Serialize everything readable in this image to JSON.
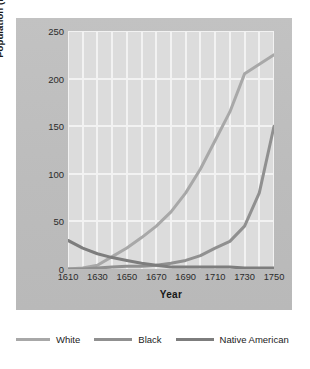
{
  "chart_data": {
    "type": "line",
    "title": "",
    "xlabel": "Year",
    "ylabel": "Population (in thousands)",
    "xlim": [
      1610,
      1750
    ],
    "ylim": [
      0,
      250
    ],
    "xticks": [
      1610,
      1630,
      1650,
      1670,
      1690,
      1710,
      1730,
      1750
    ],
    "yticks": [
      0,
      50,
      100,
      150,
      200,
      250
    ],
    "grid": true,
    "legend_position": "below",
    "x": [
      1610,
      1620,
      1630,
      1640,
      1650,
      1660,
      1670,
      1680,
      1690,
      1700,
      1710,
      1720,
      1730,
      1740,
      1750
    ],
    "series": [
      {
        "name": "White",
        "color": "#a8a8a8",
        "values": [
          0,
          1,
          4,
          13,
          22,
          33,
          45,
          60,
          80,
          105,
          135,
          165,
          205,
          215,
          225
        ]
      },
      {
        "name": "Black",
        "color": "#909090",
        "values": [
          0,
          0,
          1,
          2,
          3,
          3,
          4,
          6,
          9,
          14,
          22,
          29,
          45,
          80,
          150
        ]
      },
      {
        "name": "Native American",
        "color": "#7d7d7d",
        "values": [
          30,
          22,
          16,
          12,
          9,
          6,
          4,
          2,
          2,
          2,
          2,
          2,
          1,
          1,
          1
        ]
      }
    ]
  },
  "legend": {
    "items": [
      {
        "label": "White",
        "color": "#a8a8a8"
      },
      {
        "label": "Black",
        "color": "#909090"
      },
      {
        "label": "Native American",
        "color": "#7d7d7d"
      }
    ]
  }
}
